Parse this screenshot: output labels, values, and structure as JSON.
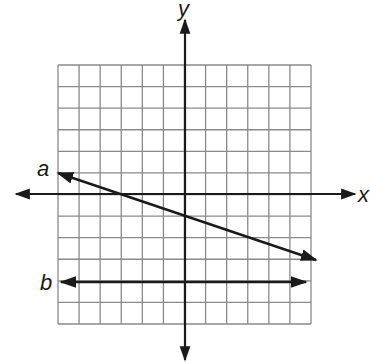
{
  "diagram": {
    "type": "coordinate-plane",
    "grid": {
      "columns": 12,
      "rows": 12,
      "x_range": [
        -6,
        6
      ],
      "y_range": [
        -6,
        6
      ],
      "color": "#8a8a8a"
    },
    "axes": {
      "x_label": "x",
      "y_label": "y",
      "color": "#1a1a1a"
    },
    "lines": [
      {
        "label": "a",
        "from": [
          -6,
          1
        ],
        "to": [
          6,
          -3
        ],
        "slope": -0.3333,
        "y_intercept": -1,
        "x_intercept": -3,
        "arrows": "both"
      },
      {
        "label": "b",
        "from": [
          -6,
          -4
        ],
        "to": [
          5.5,
          -4
        ],
        "equation": "y = -4",
        "arrows": "both"
      }
    ]
  }
}
